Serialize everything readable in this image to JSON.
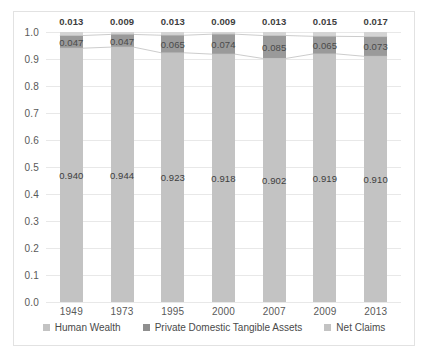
{
  "chart_data": {
    "type": "bar",
    "subtype": "stacked-bar-100",
    "title": "",
    "xlabel": "",
    "ylabel": "",
    "ylim": [
      0.0,
      1.0
    ],
    "ytick_labels": [
      "1.0",
      "0.9",
      "0.8",
      "0.7",
      "0.6",
      "0.5",
      "0.4",
      "0.3",
      "0.2",
      "0.1",
      "0.0"
    ],
    "ytick_values": [
      1.0,
      0.9,
      0.8,
      0.7,
      0.6,
      0.5,
      0.4,
      0.3,
      0.2,
      0.1,
      0.0
    ],
    "grid": true,
    "legend_position": "bottom",
    "categories": [
      "1949",
      "1973",
      "1995",
      "2000",
      "2007",
      "2009",
      "2013"
    ],
    "series": [
      {
        "name": "Human Wealth",
        "color": "#c3c3c3",
        "values": [
          0.94,
          0.944,
          0.923,
          0.918,
          0.902,
          0.919,
          0.91
        ],
        "labels": [
          "0.940",
          "0.944",
          "0.923",
          "0.918",
          "0.902",
          "0.919",
          "0.910"
        ]
      },
      {
        "name": "Private Domestic Tangible Assets",
        "color": "#9a9a9a",
        "values": [
          0.047,
          0.047,
          0.065,
          0.074,
          0.085,
          0.065,
          0.073
        ],
        "labels": [
          "0.047",
          "0.047",
          "0.065",
          "0.074",
          "0.085",
          "0.065",
          "0.073"
        ]
      },
      {
        "name": "Net Claims",
        "color": "#d4d4d4",
        "values": [
          0.013,
          0.009,
          0.013,
          0.009,
          0.013,
          0.015,
          0.017
        ],
        "labels": [
          "0.013",
          "0.009",
          "0.013",
          "0.009",
          "0.013",
          "0.015",
          "0.017"
        ]
      }
    ]
  },
  "legend": {
    "items": [
      {
        "label": "Human Wealth"
      },
      {
        "label": "Private Domestic Tangible Assets"
      },
      {
        "label": "Net Claims"
      }
    ]
  }
}
